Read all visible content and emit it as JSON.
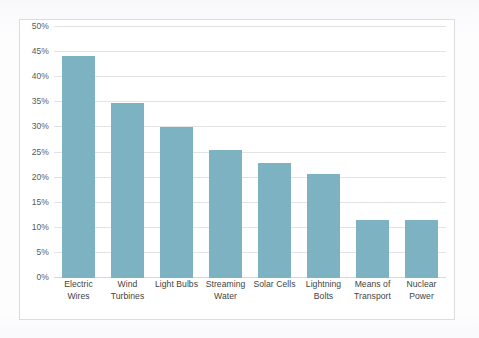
{
  "chart_data": {
    "type": "bar",
    "title": "",
    "subtitle": "",
    "xlabel": "",
    "ylabel": "",
    "categories": [
      "Electric Wires",
      "Wind Turbines",
      "Light Bulbs",
      "Streaming Water",
      "Solar Cells",
      "Lightning Bolts",
      "Means of Transport",
      "Nuclear Power"
    ],
    "values": [
      44.3,
      34.8,
      30.0,
      25.5,
      23.0,
      20.8,
      11.6,
      11.6
    ],
    "value_unit": "%",
    "ylim": [
      0,
      50
    ],
    "ytick_values": [
      0,
      5,
      10,
      15,
      20,
      25,
      30,
      35,
      40,
      45,
      50
    ],
    "ytick_labels": [
      "0%",
      "5%",
      "10%",
      "15%",
      "20%",
      "25%",
      "30%",
      "35%",
      "40%",
      "45%",
      "50%"
    ],
    "grid": true,
    "legend": false,
    "legend_position": "none",
    "series": [
      {
        "name": "Series 1",
        "values": [
          44.3,
          34.8,
          30.0,
          25.5,
          23.0,
          20.8,
          11.6,
          11.6
        ]
      }
    ]
  },
  "style": {
    "bar_color": "#7cb2c2",
    "gridline_color": "#e3e3e5",
    "border_color": "#dcdcdf",
    "plot_background": "#ffffff",
    "page_background": "#fdfdfe",
    "tick_label_color": "#5a5a5c",
    "category_label_color": "#3f3f41"
  }
}
